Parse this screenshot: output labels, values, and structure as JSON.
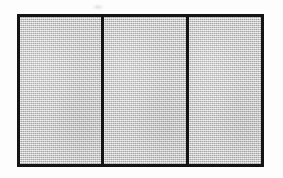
{
  "figure": {
    "label": "Three-panel framed rectangle",
    "background_color": "#fdfdfd",
    "frame": {
      "border_color": "#141414",
      "border_width_px": 3,
      "x_px": 17,
      "y_px": 14,
      "width_px": 247,
      "height_px": 153
    },
    "fill": {
      "color": "#c3c3c3",
      "texture": "dithered-halftone"
    },
    "dividers": [
      {
        "name": "divider-1",
        "x_px": 101,
        "width_px": 3,
        "color": "#141414"
      },
      {
        "name": "divider-2",
        "x_px": 186,
        "width_px": 3,
        "color": "#141414"
      }
    ],
    "panels": [
      {
        "name": "panel-left",
        "index": 1,
        "width_px": 81,
        "fill": "#c3c3c3"
      },
      {
        "name": "panel-middle",
        "index": 2,
        "width_px": 82,
        "fill": "#c3c3c3"
      },
      {
        "name": "panel-right",
        "index": 3,
        "width_px": 75,
        "fill": "#c3c3c3"
      }
    ],
    "artifacts": [
      {
        "name": "scan-smudge",
        "x_px": 92,
        "y_px": 4,
        "width_px": 12,
        "height_px": 6
      }
    ]
  }
}
